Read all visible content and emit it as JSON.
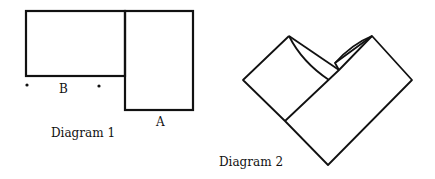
{
  "diagram1": {
    "caption": "Diagram 1",
    "label_a": "A",
    "label_b": "B"
  },
  "diagram2": {
    "caption": "Diagram 2"
  }
}
